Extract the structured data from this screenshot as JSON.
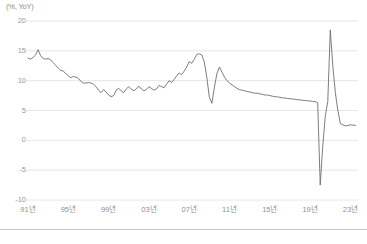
{
  "chart": {
    "unit_label": "(%, YoY)",
    "y_ticks": [
      "20",
      "15",
      "10",
      "5",
      "0",
      "-5",
      "-10"
    ],
    "x_ticks": [
      "91년",
      "95년",
      "99년",
      "03년",
      "07년",
      "11년",
      "15년",
      "19년",
      "23년"
    ]
  },
  "colors": {
    "line": "#6e6e6e",
    "grid": "#e6e6e6",
    "text": "#8f8f8f",
    "rule": "#c9c9c9",
    "background": "#ffffff"
  },
  "chart_data": {
    "type": "line",
    "title": "",
    "subtitle": "",
    "xlabel": "",
    "ylabel": "(%, YoY)",
    "ylim": [
      -10,
      20
    ],
    "xlim": [
      1991,
      2023.75
    ],
    "y_ticks": [
      20,
      15,
      10,
      5,
      0,
      -5,
      -10
    ],
    "x_ticks": [
      1991,
      1995,
      1999,
      2003,
      2007,
      2011,
      2015,
      2019,
      2023
    ],
    "x_tick_labels": [
      "91년",
      "95년",
      "99년",
      "03년",
      "07년",
      "11년",
      "15년",
      "19년",
      "23년"
    ],
    "grid": true,
    "grid_axis": "y",
    "legend": false,
    "legend_position": "none",
    "series": [
      {
        "name": "YoY growth",
        "color": "#6e6e6e",
        "points": [
          [
            1991.0,
            13.8
          ],
          [
            1991.25,
            13.6
          ],
          [
            1991.5,
            13.9
          ],
          [
            1991.75,
            14.3
          ],
          [
            1992.0,
            15.2
          ],
          [
            1992.25,
            14.2
          ],
          [
            1992.5,
            13.7
          ],
          [
            1992.75,
            13.6
          ],
          [
            1993.0,
            13.7
          ],
          [
            1993.25,
            13.5
          ],
          [
            1993.5,
            13.0
          ],
          [
            1993.75,
            12.6
          ],
          [
            1994.0,
            12.1
          ],
          [
            1994.25,
            11.7
          ],
          [
            1994.5,
            11.6
          ],
          [
            1994.75,
            11.2
          ],
          [
            1995.0,
            10.8
          ],
          [
            1995.25,
            10.5
          ],
          [
            1995.5,
            10.7
          ],
          [
            1995.75,
            10.6
          ],
          [
            1996.0,
            10.4
          ],
          [
            1996.25,
            9.9
          ],
          [
            1996.5,
            9.6
          ],
          [
            1996.75,
            9.6
          ],
          [
            1997.0,
            9.7
          ],
          [
            1997.25,
            9.6
          ],
          [
            1997.5,
            9.4
          ],
          [
            1997.75,
            9.0
          ],
          [
            1998.0,
            8.4
          ],
          [
            1998.25,
            8.0
          ],
          [
            1998.5,
            8.5
          ],
          [
            1998.75,
            8.1
          ],
          [
            1999.0,
            7.6
          ],
          [
            1999.25,
            7.3
          ],
          [
            1999.5,
            7.5
          ],
          [
            1999.75,
            8.4
          ],
          [
            2000.0,
            8.7
          ],
          [
            2000.25,
            8.3
          ],
          [
            2000.5,
            8.0
          ],
          [
            2000.75,
            8.6
          ],
          [
            2001.0,
            9.0
          ],
          [
            2001.25,
            8.6
          ],
          [
            2001.5,
            8.3
          ],
          [
            2001.75,
            8.6
          ],
          [
            2002.0,
            9.1
          ],
          [
            2002.25,
            8.6
          ],
          [
            2002.5,
            8.3
          ],
          [
            2002.75,
            8.5
          ],
          [
            2003.0,
            9.0
          ],
          [
            2003.25,
            8.7
          ],
          [
            2003.5,
            8.4
          ],
          [
            2003.75,
            8.6
          ],
          [
            2004.0,
            9.2
          ],
          [
            2004.25,
            9.0
          ],
          [
            2004.5,
            8.8
          ],
          [
            2004.75,
            9.4
          ],
          [
            2005.0,
            10.0
          ],
          [
            2005.25,
            9.7
          ],
          [
            2005.5,
            10.2
          ],
          [
            2005.75,
            10.8
          ],
          [
            2006.0,
            11.3
          ],
          [
            2006.25,
            11.0
          ],
          [
            2006.5,
            11.6
          ],
          [
            2006.75,
            12.3
          ],
          [
            2007.0,
            13.2
          ],
          [
            2007.25,
            12.9
          ],
          [
            2007.5,
            13.6
          ],
          [
            2007.75,
            14.4
          ],
          [
            2008.0,
            14.5
          ],
          [
            2008.25,
            14.3
          ],
          [
            2008.5,
            13.1
          ],
          [
            2008.75,
            10.5
          ],
          [
            2009.0,
            7.2
          ],
          [
            2009.25,
            6.2
          ],
          [
            2009.5,
            8.9
          ],
          [
            2009.75,
            11.2
          ],
          [
            2010.0,
            12.3
          ],
          [
            2010.25,
            11.4
          ],
          [
            2010.5,
            10.6
          ],
          [
            2010.75,
            10.0
          ],
          [
            2011.0,
            9.6
          ],
          [
            2011.25,
            9.3
          ],
          [
            2011.5,
            9.0
          ],
          [
            2011.75,
            8.7
          ],
          [
            2012.0,
            8.5
          ],
          [
            2012.25,
            8.4
          ],
          [
            2012.5,
            8.3
          ],
          [
            2012.75,
            8.2
          ],
          [
            2013.0,
            8.1
          ],
          [
            2013.25,
            8.0
          ],
          [
            2013.5,
            7.9
          ],
          [
            2013.75,
            7.9
          ],
          [
            2014.0,
            7.8
          ],
          [
            2014.25,
            7.7
          ],
          [
            2014.5,
            7.6
          ],
          [
            2014.75,
            7.6
          ],
          [
            2015.0,
            7.5
          ],
          [
            2015.25,
            7.4
          ],
          [
            2015.5,
            7.3
          ],
          [
            2015.75,
            7.3
          ],
          [
            2016.0,
            7.2
          ],
          [
            2016.25,
            7.1
          ],
          [
            2016.5,
            7.1
          ],
          [
            2016.75,
            7.0
          ],
          [
            2017.0,
            7.0
          ],
          [
            2017.25,
            6.9
          ],
          [
            2017.5,
            6.9
          ],
          [
            2017.75,
            6.8
          ],
          [
            2018.0,
            6.8
          ],
          [
            2018.25,
            6.7
          ],
          [
            2018.5,
            6.7
          ],
          [
            2018.75,
            6.6
          ],
          [
            2019.0,
            6.6
          ],
          [
            2019.25,
            6.5
          ],
          [
            2019.5,
            6.5
          ],
          [
            2019.75,
            6.3
          ],
          [
            2020.0,
            -7.5
          ],
          [
            2020.25,
            -1.0
          ],
          [
            2020.5,
            4.0
          ],
          [
            2020.75,
            6.5
          ],
          [
            2021.0,
            18.5
          ],
          [
            2021.25,
            12.5
          ],
          [
            2021.5,
            8.0
          ],
          [
            2021.75,
            5.0
          ],
          [
            2022.0,
            2.8
          ],
          [
            2022.5,
            2.4
          ],
          [
            2023.0,
            2.6
          ],
          [
            2023.5,
            2.5
          ]
        ]
      }
    ]
  }
}
